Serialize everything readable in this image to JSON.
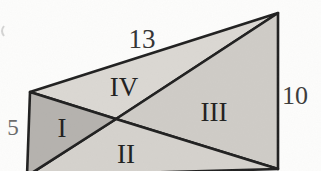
{
  "figure": {
    "side_labels": {
      "top": "13",
      "right": "10",
      "left": "5"
    },
    "region_labels": {
      "i": "I",
      "ii": "II",
      "iii": "III",
      "iv": "IV"
    },
    "colors": {
      "line": "#1f1f1f",
      "region_i": "#b5b2ae",
      "region_ii": "#d5d2cd",
      "region_iii": "#cfccc7",
      "region_iv": "#dbd8d3",
      "label_roman": "#1e1e1e",
      "label_top": "#333333",
      "label_right": "#3a3a3a",
      "label_left": "#6a6a6a",
      "background": "#fdfdfc",
      "artifact": "#c2c2c2"
    }
  }
}
